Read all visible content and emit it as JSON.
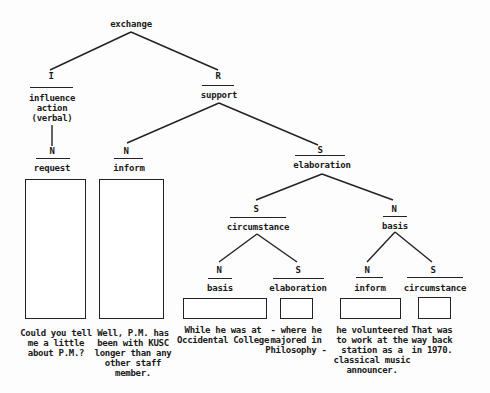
{
  "diagram": {
    "type": "rhetorical-structure-tree",
    "root": {
      "label": "exchange"
    },
    "nodes": {
      "I": {
        "role": "I",
        "relation": "influence\naction\n(verbal)"
      },
      "R": {
        "role": "R",
        "relation": "support"
      },
      "request": {
        "role": "N",
        "relation": "request"
      },
      "inform_top": {
        "role": "N",
        "relation": "inform"
      },
      "elaboration_top": {
        "role": "S",
        "relation": "elaboration"
      },
      "circumstance_mid": {
        "role": "S",
        "relation": "circumstance"
      },
      "basis_mid": {
        "role": "N",
        "relation": "basis"
      },
      "basis_leaf": {
        "role": "N",
        "relation": "basis"
      },
      "elaboration_leaf": {
        "role": "S",
        "relation": "elaboration"
      },
      "inform_leaf": {
        "role": "N",
        "relation": "inform"
      },
      "circumstance_leaf": {
        "role": "S",
        "relation": "circumstance"
      }
    },
    "texts": {
      "request": "Could you tell\nme a little\nabout P.M.?",
      "inform_top": "Well, P.M. has\nbeen with KUSC\nlonger than any\nother staff\nmember.",
      "basis_leaf": "While he was at\nOccidental College",
      "elaboration_leaf": "- where he\nmajored in\nPhilosophy -",
      "inform_leaf": "he volunteered\nto work at the\nstation as a\nclassical music\nannouncer.",
      "circumstance_leaf": "That was\nway back\nin 1970."
    }
  }
}
